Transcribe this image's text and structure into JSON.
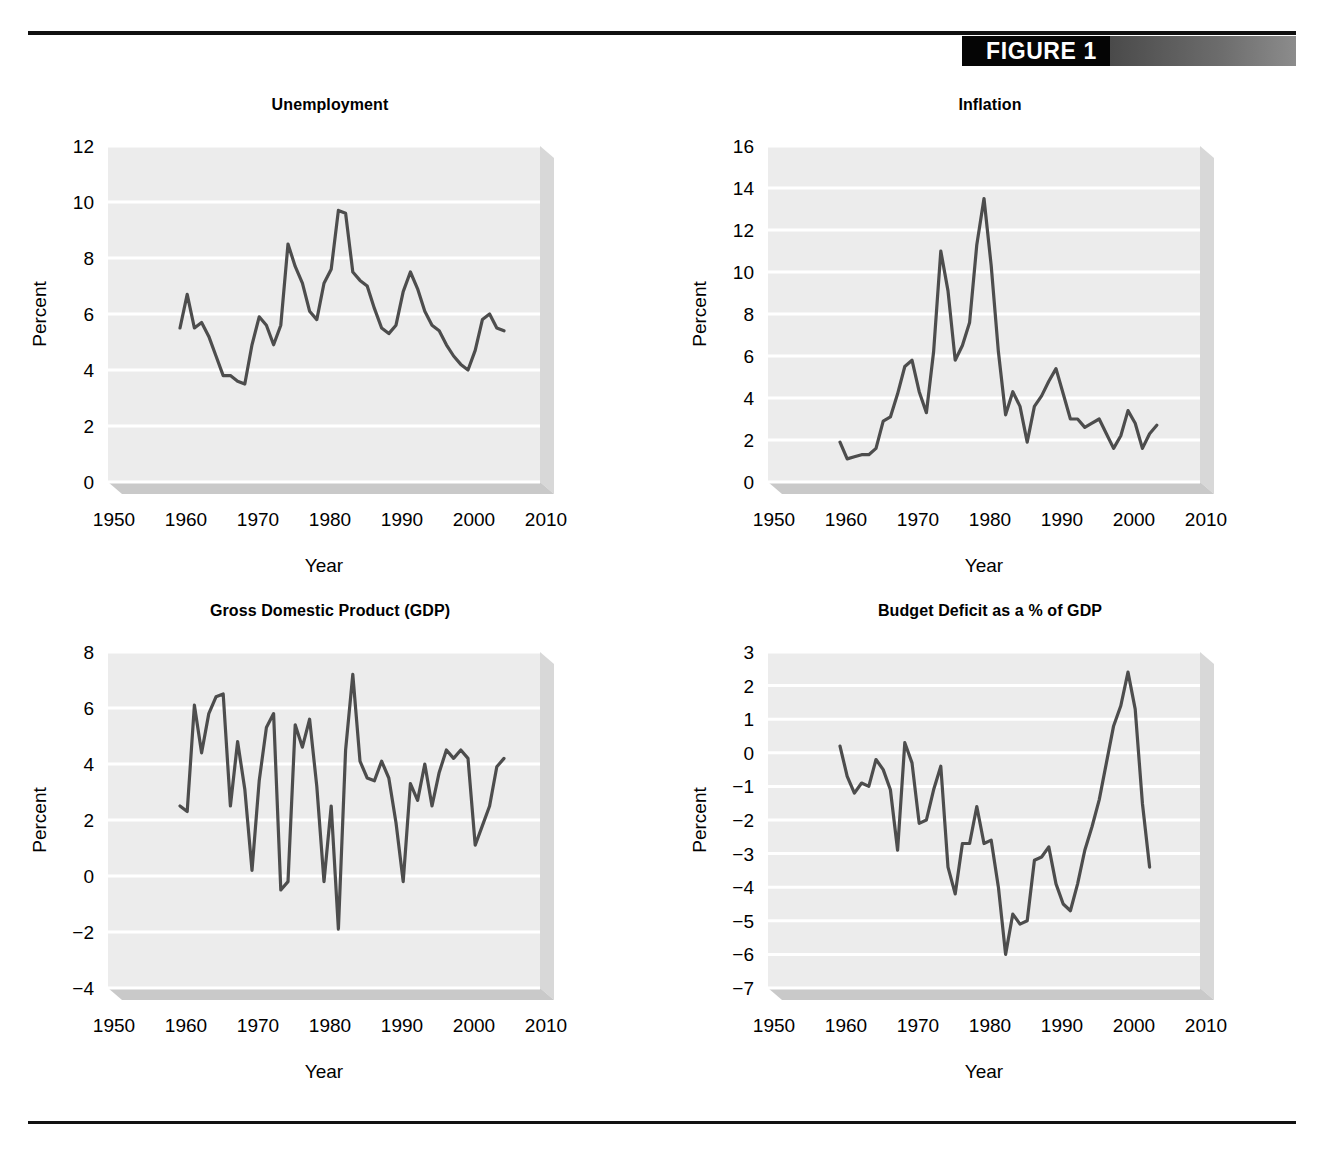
{
  "figure": {
    "label": "FIGURE 1",
    "accent_black": "#050505",
    "accent_gray": "#8c8c8c",
    "line_color": "#4d4d4d",
    "panel_bg": "#ececec",
    "gridline_color": "#ffffff"
  },
  "axis_common": {
    "xlabel": "Year",
    "ylabel": "Percent",
    "xticks": [
      1950,
      1960,
      1970,
      1980,
      1990,
      2000,
      2010
    ],
    "xlim": [
      1950,
      2010
    ]
  },
  "chart_data": [
    {
      "type": "line",
      "id": "unemployment",
      "title": "Unemployment",
      "xlabel": "Year",
      "ylabel": "Percent",
      "xlim": [
        1950,
        2010
      ],
      "ylim": [
        0,
        12
      ],
      "yticks": [
        0,
        2,
        4,
        6,
        8,
        10,
        12
      ],
      "xticks": [
        1950,
        1960,
        1970,
        1980,
        1990,
        2000,
        2010
      ],
      "grid": true,
      "legend": "none",
      "x": [
        1960,
        1961,
        1962,
        1963,
        1964,
        1965,
        1966,
        1967,
        1968,
        1969,
        1970,
        1971,
        1972,
        1973,
        1974,
        1975,
        1976,
        1977,
        1978,
        1979,
        1980,
        1981,
        1982,
        1983,
        1984,
        1985,
        1986,
        1987,
        1988,
        1989,
        1990,
        1991,
        1992,
        1993,
        1994,
        1995,
        1996,
        1997,
        1998,
        1999,
        2000,
        2001,
        2002,
        2003,
        2004,
        2005
      ],
      "values": [
        5.5,
        6.7,
        5.5,
        5.7,
        5.2,
        4.5,
        3.8,
        3.8,
        3.6,
        3.5,
        4.9,
        5.9,
        5.6,
        4.9,
        5.6,
        8.5,
        7.7,
        7.1,
        6.1,
        5.8,
        7.1,
        7.6,
        9.7,
        9.6,
        7.5,
        7.2,
        7.0,
        6.2,
        5.5,
        5.3,
        5.6,
        6.8,
        7.5,
        6.9,
        6.1,
        5.6,
        5.4,
        4.9,
        4.5,
        4.2,
        4.0,
        4.7,
        5.8,
        6.0,
        5.5,
        5.4
      ]
    },
    {
      "type": "line",
      "id": "inflation",
      "title": "Inflation",
      "xlabel": "Year",
      "ylabel": "Percent",
      "xlim": [
        1950,
        2010
      ],
      "ylim": [
        0,
        16
      ],
      "yticks": [
        0,
        2,
        4,
        6,
        8,
        10,
        12,
        14,
        16
      ],
      "xticks": [
        1950,
        1960,
        1970,
        1980,
        1990,
        2000,
        2010
      ],
      "grid": true,
      "legend": "none",
      "x": [
        1960,
        1961,
        1962,
        1963,
        1964,
        1965,
        1966,
        1967,
        1968,
        1969,
        1970,
        1971,
        1972,
        1973,
        1974,
        1975,
        1976,
        1977,
        1978,
        1979,
        1980,
        1981,
        1982,
        1983,
        1984,
        1985,
        1986,
        1987,
        1988,
        1989,
        1990,
        1991,
        1992,
        1993,
        1994,
        1995,
        1996,
        1997,
        1998,
        1999,
        2000,
        2001,
        2002,
        2003,
        2004
      ],
      "values": [
        1.9,
        1.1,
        1.2,
        1.3,
        1.3,
        1.6,
        2.9,
        3.1,
        4.2,
        5.5,
        5.8,
        4.3,
        3.3,
        6.2,
        11.0,
        9.1,
        5.8,
        6.5,
        7.6,
        11.3,
        13.5,
        10.3,
        6.2,
        3.2,
        4.3,
        3.6,
        1.9,
        3.6,
        4.1,
        4.8,
        5.4,
        4.2,
        3.0,
        3.0,
        2.6,
        2.8,
        3.0,
        2.3,
        1.6,
        2.2,
        3.4,
        2.8,
        1.6,
        2.3,
        2.7
      ]
    },
    {
      "type": "line",
      "id": "gdp",
      "title": "Gross Domestic Product (GDP)",
      "xlabel": "Year",
      "ylabel": "Percent",
      "xlim": [
        1950,
        2010
      ],
      "ylim": [
        -4,
        8
      ],
      "yticks": [
        -4,
        -2,
        0,
        2,
        4,
        6,
        8
      ],
      "xticks": [
        1950,
        1960,
        1970,
        1980,
        1990,
        2000,
        2010
      ],
      "grid": true,
      "legend": "none",
      "x": [
        1960,
        1961,
        1962,
        1963,
        1964,
        1965,
        1966,
        1967,
        1968,
        1969,
        1970,
        1971,
        1972,
        1973,
        1974,
        1975,
        1976,
        1977,
        1978,
        1979,
        1980,
        1981,
        1982,
        1983,
        1984,
        1985,
        1986,
        1987,
        1988,
        1989,
        1990,
        1991,
        1992,
        1993,
        1994,
        1995,
        1996,
        1997,
        1998,
        1999,
        2000,
        2001,
        2002,
        2003,
        2004,
        2005
      ],
      "values": [
        2.5,
        2.3,
        6.1,
        4.4,
        5.8,
        6.4,
        6.5,
        2.5,
        4.8,
        3.1,
        0.2,
        3.4,
        5.3,
        5.8,
        -0.5,
        -0.2,
        5.4,
        4.6,
        5.6,
        3.2,
        -0.2,
        2.5,
        -1.9,
        4.5,
        7.2,
        4.1,
        3.5,
        3.4,
        4.1,
        3.5,
        1.9,
        -0.2,
        3.3,
        2.7,
        4.0,
        2.5,
        3.7,
        4.5,
        4.2,
        4.5,
        4.2,
        1.1,
        1.8,
        2.5,
        3.9,
        4.2
      ]
    },
    {
      "type": "line",
      "id": "budget_deficit",
      "title": "Budget Deficit as a % of GDP",
      "xlabel": "Year",
      "ylabel": "Percent",
      "xlim": [
        1950,
        2010
      ],
      "ylim": [
        -7,
        3
      ],
      "yticks": [
        -7,
        -6,
        -5,
        -4,
        -3,
        -2,
        -1,
        0,
        1,
        2,
        3
      ],
      "xticks": [
        1950,
        1960,
        1970,
        1980,
        1990,
        2000,
        2010
      ],
      "grid": true,
      "legend": "none",
      "x": [
        1960,
        1961,
        1962,
        1963,
        1964,
        1965,
        1966,
        1967,
        1968,
        1969,
        1970,
        1971,
        1972,
        1973,
        1974,
        1975,
        1976,
        1977,
        1978,
        1979,
        1980,
        1981,
        1982,
        1983,
        1984,
        1985,
        1986,
        1987,
        1988,
        1989,
        1990,
        1991,
        1992,
        1993,
        1994,
        1995,
        1996,
        1997,
        1998,
        1999,
        2000,
        2001,
        2002,
        2003
      ],
      "values": [
        0.2,
        -0.7,
        -1.2,
        -0.9,
        -1.0,
        -0.2,
        -0.5,
        -1.1,
        -2.9,
        0.3,
        -0.3,
        -2.1,
        -2.0,
        -1.1,
        -0.4,
        -3.4,
        -4.2,
        -2.7,
        -2.7,
        -1.6,
        -2.7,
        -2.6,
        -4.0,
        -6.0,
        -4.8,
        -5.1,
        -5.0,
        -3.2,
        -3.1,
        -2.8,
        -3.9,
        -4.5,
        -4.7,
        -3.9,
        -2.9,
        -2.2,
        -1.4,
        -0.3,
        0.8,
        1.4,
        2.4,
        1.3,
        -1.5,
        -3.4
      ]
    }
  ]
}
